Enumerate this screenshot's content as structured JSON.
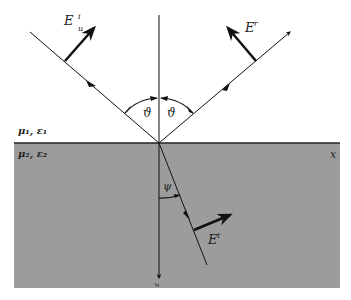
{
  "figure": {
    "medium1": {
      "label": "μ₁, ε₁"
    },
    "medium2": {
      "label": "μ₂, ε₂",
      "color": "#9a9a9a"
    },
    "axes": {
      "x": "x",
      "z": "z"
    },
    "incident": {
      "field": "E",
      "sub": "u",
      "sup": "i"
    },
    "reflected": {
      "field": "E",
      "sup": "r"
    },
    "transmitted": {
      "field": "E",
      "sup": "t"
    },
    "angles": {
      "incidence": "ϑ",
      "reflection": "ϑ",
      "refraction": "ψ"
    }
  }
}
